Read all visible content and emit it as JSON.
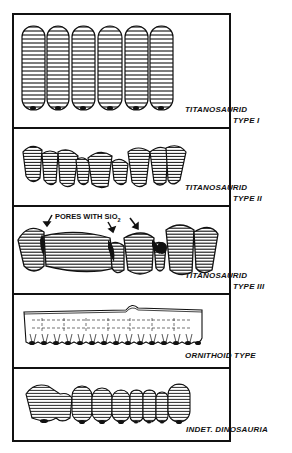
{
  "panels": [
    {
      "id": "titanosaurid-type-1",
      "label_line1": "TITANOSAURID",
      "label_line2": "TYPE I",
      "specimen": {
        "teeth_count": 6,
        "shape": "tall elongated rounded cylinders, banded"
      }
    },
    {
      "id": "titanosaurid-type-2",
      "label_line1": "TITANOSAURID",
      "label_line2": "TYPE II",
      "specimen": {
        "teeth_count": 11,
        "shape": "short rounded irregular cones, banded"
      }
    },
    {
      "id": "titanosaurid-type-3",
      "label_line1": "TITANOSAURID",
      "label_line2": "TYPE III",
      "annotation": {
        "text": "PORES WITH SiO",
        "subscript": "2"
      },
      "specimen": {
        "teeth_count": 8,
        "shape": "fused bulbous masses with dark pores"
      }
    },
    {
      "id": "ornithoid-type",
      "label_line1": "ORNITHOID TYPE",
      "label_line2": "",
      "specimen": {
        "teeth_count": 15,
        "shape": "flat rectangular layer with fine base columns and central bump"
      }
    },
    {
      "id": "indet-dinosauria",
      "label_line1": "INDET. DINOSAURIA",
      "label_line2": "",
      "specimen": {
        "teeth_count": 10,
        "shape": "rounded cylinders, banded"
      }
    }
  ]
}
